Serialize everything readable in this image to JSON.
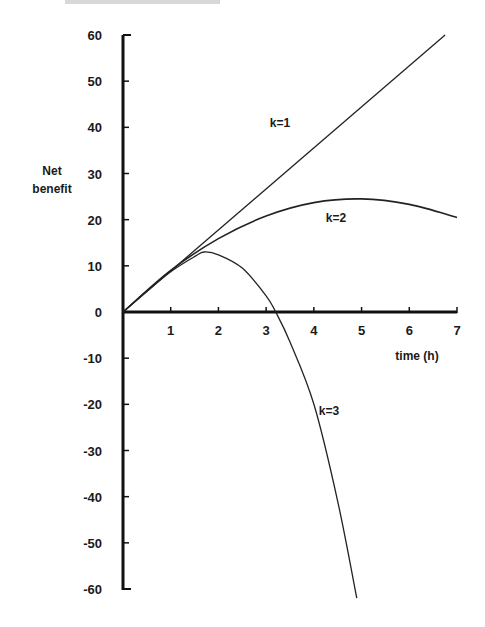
{
  "chart_data": {
    "type": "line",
    "title": "",
    "xlabel": "time (h)",
    "ylabel": "Net benefit",
    "xlim": [
      0,
      7
    ],
    "ylim": [
      -60,
      60
    ],
    "grid": false,
    "legend": "inline labels",
    "x_ticks": [
      "1",
      "2",
      "3",
      "4",
      "5",
      "6",
      "7"
    ],
    "y_ticks": [
      "60",
      "50",
      "40",
      "30",
      "20",
      "10",
      "0",
      "-10",
      "-20",
      "-30",
      "-40",
      "-50",
      "-60"
    ],
    "series": [
      {
        "name": "k=1",
        "x": [
          0,
          1,
          2,
          3,
          4,
          5,
          6,
          6.75
        ],
        "values": [
          0,
          8.9,
          17.8,
          26.7,
          35.6,
          44.5,
          53.4,
          60
        ]
      },
      {
        "name": "k=2",
        "x": [
          0,
          1,
          2,
          3,
          4,
          5,
          6,
          7
        ],
        "values": [
          0,
          9,
          15.9,
          20.8,
          23.7,
          24.5,
          23.3,
          20.5
        ]
      },
      {
        "name": "k=3",
        "x": [
          0,
          0.5,
          1,
          1.5,
          1.7,
          2,
          2.5,
          3,
          3.2,
          3.5,
          4,
          4.5,
          4.9
        ],
        "values": [
          0,
          4.5,
          8.7,
          12,
          13,
          12.4,
          9.5,
          3.5,
          0,
          -6.5,
          -20,
          -41,
          -62
        ]
      }
    ]
  },
  "labels": {
    "ylabel_line1": "Net",
    "ylabel_line2": "benefit",
    "xlabel": "time (h)",
    "k1": "k=1",
    "k2": "k=2",
    "k3": "k=3",
    "x_origin": "0"
  }
}
